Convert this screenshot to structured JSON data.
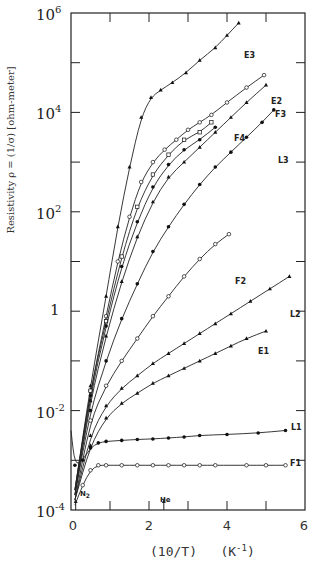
{
  "chart_data": {
    "type": "line",
    "title": "",
    "xlabel": "(10/T)   (K^-1)",
    "ylabel": "Resistivity ρ = (1/σ) [ohm-meter]",
    "xlim": [
      0,
      6
    ],
    "ylim_log10": [
      -4,
      6
    ],
    "yscale": "log",
    "grid": false,
    "legend": "inline labels at line ends",
    "x_ticks": [
      "0",
      "2",
      "4",
      "6"
    ],
    "y_ticks": [
      "10^-4",
      "10^-2",
      "1",
      "10^2",
      "10^4",
      "10^6"
    ],
    "annotations": [
      {
        "text": "N2",
        "x": 0.12,
        "note": "arrow marker on x-axis"
      },
      {
        "text": "He",
        "x": 2.38,
        "note": "arrow marker on x-axis"
      }
    ],
    "series": [
      {
        "name": "E3",
        "marker": "filled-triangle",
        "points_log10": [
          [
            0.1,
            -3.6
          ],
          [
            0.5,
            -1.5
          ],
          [
            0.9,
            0.3
          ],
          [
            1.2,
            1.7
          ],
          [
            1.5,
            2.9
          ],
          [
            1.8,
            3.9
          ],
          [
            2.05,
            4.3
          ],
          [
            2.3,
            4.45
          ],
          [
            2.6,
            4.6
          ],
          [
            2.95,
            4.8
          ],
          [
            3.3,
            5.05
          ],
          [
            3.7,
            5.3
          ],
          [
            4.0,
            5.55
          ],
          [
            4.3,
            5.8
          ]
        ]
      },
      {
        "name": "E2",
        "marker": "open-circle",
        "points_log10": [
          [
            0.1,
            -3.6
          ],
          [
            0.5,
            -1.6
          ],
          [
            0.9,
            -0.1
          ],
          [
            1.2,
            1.0
          ],
          [
            1.5,
            1.9
          ],
          [
            1.8,
            2.6
          ],
          [
            2.1,
            3.0
          ],
          [
            2.4,
            3.25
          ],
          [
            2.7,
            3.45
          ],
          [
            3.0,
            3.65
          ],
          [
            3.3,
            3.8
          ],
          [
            3.6,
            3.95
          ],
          [
            4.0,
            4.2
          ],
          [
            4.5,
            4.5
          ],
          [
            4.95,
            4.75
          ]
        ]
      },
      {
        "name": "F4",
        "marker": "open-square",
        "points_log10": [
          [
            0.1,
            -3.6
          ],
          [
            0.5,
            -1.6
          ],
          [
            0.9,
            -0.2
          ],
          [
            1.3,
            1.1
          ],
          [
            1.7,
            2.1
          ],
          [
            2.1,
            2.75
          ],
          [
            2.5,
            3.15
          ],
          [
            2.9,
            3.45
          ],
          [
            3.3,
            3.6
          ],
          [
            3.6,
            3.8
          ]
        ]
      },
      {
        "name": "F3",
        "marker": "filled-triangle",
        "points_log10": [
          [
            0.1,
            -3.7
          ],
          [
            0.5,
            -1.8
          ],
          [
            0.9,
            -0.5
          ],
          [
            1.3,
            0.6
          ],
          [
            1.7,
            1.5
          ],
          [
            2.1,
            2.2
          ],
          [
            2.5,
            2.7
          ],
          [
            2.9,
            3.0
          ],
          [
            3.3,
            3.3
          ],
          [
            3.7,
            3.6
          ],
          [
            4.1,
            3.9
          ],
          [
            4.5,
            4.2
          ],
          [
            5.0,
            4.55
          ]
        ]
      },
      {
        "name": "F3b",
        "marker": "filled-circle",
        "points_log10": [
          [
            0.1,
            -3.7
          ],
          [
            0.5,
            -1.7
          ],
          [
            0.9,
            -0.3
          ],
          [
            1.3,
            0.9
          ],
          [
            1.7,
            1.8
          ],
          [
            2.1,
            2.5
          ],
          [
            2.5,
            2.95
          ],
          [
            2.9,
            3.25
          ],
          [
            3.3,
            3.45
          ],
          [
            3.7,
            3.7
          ]
        ]
      },
      {
        "name": "L3",
        "marker": "filled-circle",
        "points_log10": [
          [
            0.1,
            -3.7
          ],
          [
            0.5,
            -2.0
          ],
          [
            0.9,
            -1.0
          ],
          [
            1.3,
            -0.15
          ],
          [
            1.7,
            0.55
          ],
          [
            2.1,
            1.2
          ],
          [
            2.5,
            1.7
          ],
          [
            2.9,
            2.15
          ],
          [
            3.3,
            2.55
          ],
          [
            3.7,
            2.9
          ],
          [
            4.1,
            3.2
          ],
          [
            4.5,
            3.5
          ],
          [
            4.9,
            3.8
          ],
          [
            5.2,
            4.05
          ]
        ]
      },
      {
        "name": "F2",
        "marker": "open-circle",
        "points_log10": [
          [
            0.1,
            -3.8
          ],
          [
            0.5,
            -2.2
          ],
          [
            0.9,
            -1.5
          ],
          [
            1.3,
            -1.0
          ],
          [
            1.7,
            -0.55
          ],
          [
            2.1,
            -0.1
          ],
          [
            2.5,
            0.3
          ],
          [
            2.9,
            0.7
          ],
          [
            3.3,
            1.05
          ],
          [
            3.7,
            1.35
          ],
          [
            4.05,
            1.55
          ]
        ]
      },
      {
        "name": "L2",
        "marker": "filled-triangle",
        "points_log10": [
          [
            0.1,
            -3.8
          ],
          [
            0.5,
            -2.5
          ],
          [
            0.9,
            -1.9
          ],
          [
            1.3,
            -1.55
          ],
          [
            1.7,
            -1.3
          ],
          [
            2.1,
            -1.05
          ],
          [
            2.5,
            -0.85
          ],
          [
            2.9,
            -0.65
          ],
          [
            3.3,
            -0.45
          ],
          [
            3.7,
            -0.25
          ],
          [
            4.1,
            -0.05
          ],
          [
            4.6,
            0.2
          ],
          [
            5.1,
            0.45
          ],
          [
            5.6,
            0.7
          ]
        ]
      },
      {
        "name": "E1",
        "marker": "filled-triangle",
        "points_log10": [
          [
            0.1,
            -3.8
          ],
          [
            0.5,
            -2.7
          ],
          [
            0.9,
            -2.15
          ],
          [
            1.3,
            -1.85
          ],
          [
            1.7,
            -1.65
          ],
          [
            2.1,
            -1.45
          ],
          [
            2.5,
            -1.3
          ],
          [
            2.9,
            -1.15
          ],
          [
            3.3,
            -1.0
          ],
          [
            3.7,
            -0.85
          ],
          [
            4.1,
            -0.7
          ],
          [
            4.5,
            -0.55
          ],
          [
            5.0,
            -0.4
          ]
        ]
      },
      {
        "name": "L1",
        "marker": "filled-circle",
        "points_log10": [
          [
            0.0,
            -2.4
          ],
          [
            0.1,
            -3.1
          ],
          [
            0.3,
            -3.0
          ],
          [
            0.5,
            -2.75
          ],
          [
            0.7,
            -2.65
          ],
          [
            0.9,
            -2.62
          ],
          [
            1.3,
            -2.6
          ],
          [
            1.7,
            -2.58
          ],
          [
            2.1,
            -2.57
          ],
          [
            2.5,
            -2.55
          ],
          [
            2.9,
            -2.53
          ],
          [
            3.3,
            -2.5
          ],
          [
            4.0,
            -2.48
          ],
          [
            4.8,
            -2.45
          ],
          [
            5.5,
            -2.4
          ]
        ]
      },
      {
        "name": "F1",
        "marker": "open-circle",
        "points_log10": [
          [
            0.1,
            -3.9
          ],
          [
            0.3,
            -3.5
          ],
          [
            0.5,
            -3.2
          ],
          [
            0.7,
            -3.1
          ],
          [
            0.9,
            -3.1
          ],
          [
            1.3,
            -3.1
          ],
          [
            1.7,
            -3.1
          ],
          [
            2.1,
            -3.1
          ],
          [
            2.5,
            -3.1
          ],
          [
            2.9,
            -3.1
          ],
          [
            3.3,
            -3.1
          ],
          [
            3.7,
            -3.1
          ],
          [
            4.5,
            -3.1
          ],
          [
            5.0,
            -3.1
          ],
          [
            5.5,
            -3.1
          ]
        ]
      }
    ]
  },
  "labels": {
    "xlabel_main": "(10/T)   (K",
    "xlabel_sup": "-1",
    "xlabel_close": ")",
    "ylabel": "Resistivity ρ = (1/σ) [ohm-meter]",
    "ytick_base": "10",
    "ytick_exps": [
      "6",
      "4",
      "2",
      "",
      "-2",
      "-4"
    ],
    "ytick_one": "1",
    "xticks": [
      "0",
      "2",
      "4",
      "6"
    ],
    "n2": "N",
    "n2_sub": "2",
    "he": "He"
  },
  "series_labels": [
    "E3",
    "E2",
    "F3",
    "F4",
    "L3",
    "F2",
    "L2",
    "E1",
    "L1",
    "F1"
  ]
}
